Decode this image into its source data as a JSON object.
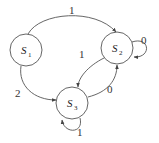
{
  "diagram": {
    "type": "state-transition-diagram",
    "states": [
      {
        "id": "S1",
        "label": "S",
        "sub": "1"
      },
      {
        "id": "S2",
        "label": "S",
        "sub": "2"
      },
      {
        "id": "S3",
        "label": "S",
        "sub": "3"
      }
    ],
    "transitions": [
      {
        "from": "S1",
        "to": "S2",
        "label": "1"
      },
      {
        "from": "S2",
        "to": "S2",
        "label": "0"
      },
      {
        "from": "S2",
        "to": "S3",
        "label": "1"
      },
      {
        "from": "S3",
        "to": "S2",
        "label": "0"
      },
      {
        "from": "S1",
        "to": "S3",
        "label": "2"
      },
      {
        "from": "S3",
        "to": "S3",
        "label": "1"
      }
    ]
  }
}
